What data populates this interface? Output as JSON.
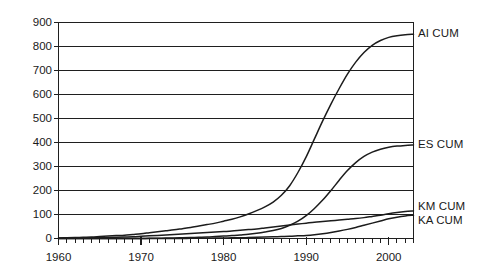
{
  "chart_data": {
    "type": "line",
    "title": "",
    "subtitle": "",
    "xlabel": "",
    "ylabel": "",
    "xlim": [
      1960,
      2003
    ],
    "ylim": [
      0,
      900
    ],
    "grid": true,
    "legend_position": "right-of-plot-at-series-end",
    "y_ticks": [
      0,
      100,
      200,
      300,
      400,
      500,
      600,
      700,
      800,
      900
    ],
    "y_tick_labels": [
      "0",
      "100",
      "200",
      "300",
      "400",
      "500",
      "600",
      "700",
      "800",
      "900"
    ],
    "x_ticks": [
      1960,
      1970,
      1980,
      1990,
      2000
    ],
    "x_tick_labels": [
      "1960",
      "1970",
      "1980",
      "1990",
      "2000"
    ],
    "x_minor_tick_interval": 1,
    "series": [
      {
        "name": "AI CUM",
        "label": "AI CUM",
        "color": "#1c1c1c",
        "x": [
          1960,
          1961,
          1962,
          1963,
          1964,
          1965,
          1966,
          1967,
          1968,
          1969,
          1970,
          1971,
          1972,
          1973,
          1974,
          1975,
          1976,
          1977,
          1978,
          1979,
          1980,
          1981,
          1982,
          1983,
          1984,
          1985,
          1986,
          1987,
          1988,
          1989,
          1990,
          1991,
          1992,
          1993,
          1994,
          1995,
          1996,
          1997,
          1998,
          1999,
          2000,
          2001,
          2002,
          2003
        ],
        "values": [
          2,
          3,
          4,
          5,
          6,
          8,
          10,
          12,
          14,
          17,
          20,
          24,
          28,
          32,
          36,
          41,
          46,
          52,
          58,
          64,
          72,
          80,
          90,
          102,
          116,
          132,
          152,
          180,
          220,
          275,
          340,
          415,
          490,
          560,
          625,
          685,
          735,
          775,
          805,
          825,
          838,
          845,
          849,
          851
        ],
        "end_value": 851
      },
      {
        "name": "ES CUM",
        "label": "ES CUM",
        "color": "#1c1c1c",
        "x": [
          1960,
          1961,
          1962,
          1963,
          1964,
          1965,
          1966,
          1967,
          1968,
          1969,
          1970,
          1971,
          1972,
          1973,
          1974,
          1975,
          1976,
          1977,
          1978,
          1979,
          1980,
          1981,
          1982,
          1983,
          1984,
          1985,
          1986,
          1987,
          1988,
          1989,
          1990,
          1991,
          1992,
          1993,
          1994,
          1995,
          1996,
          1997,
          1998,
          1999,
          2000,
          2001,
          2002,
          2003
        ],
        "values": [
          0,
          0,
          0,
          0,
          0,
          0,
          0,
          0,
          0,
          0,
          0,
          1,
          1,
          2,
          2,
          3,
          4,
          5,
          6,
          8,
          10,
          12,
          15,
          18,
          22,
          27,
          33,
          42,
          55,
          72,
          95,
          125,
          160,
          200,
          243,
          283,
          316,
          342,
          360,
          372,
          380,
          385,
          388,
          390
        ],
        "end_value": 390
      },
      {
        "name": "KM CUM",
        "label": "KM CUM",
        "color": "#1c1c1c",
        "x": [
          1960,
          1961,
          1962,
          1963,
          1964,
          1965,
          1966,
          1967,
          1968,
          1969,
          1970,
          1971,
          1972,
          1973,
          1974,
          1975,
          1976,
          1977,
          1978,
          1979,
          1980,
          1981,
          1982,
          1983,
          1984,
          1985,
          1986,
          1987,
          1988,
          1989,
          1990,
          1991,
          1992,
          1993,
          1994,
          1995,
          1996,
          1997,
          1998,
          1999,
          2000,
          2001,
          2002,
          2003
        ],
        "values": [
          1,
          1,
          2,
          2,
          3,
          3,
          4,
          5,
          6,
          7,
          9,
          11,
          13,
          15,
          17,
          19,
          21,
          23,
          25,
          27,
          29,
          31,
          34,
          37,
          40,
          44,
          48,
          52,
          56,
          60,
          64,
          68,
          71,
          74,
          77,
          80,
          83,
          87,
          92,
          97,
          103,
          108,
          112,
          115
        ],
        "end_value": 115
      },
      {
        "name": "KA CUM",
        "label": "KA CUM",
        "color": "#1c1c1c",
        "x": [
          1960,
          1961,
          1962,
          1963,
          1964,
          1965,
          1966,
          1967,
          1968,
          1969,
          1970,
          1971,
          1972,
          1973,
          1974,
          1975,
          1976,
          1977,
          1978,
          1979,
          1980,
          1981,
          1982,
          1983,
          1984,
          1985,
          1986,
          1987,
          1988,
          1989,
          1990,
          1991,
          1992,
          1993,
          1994,
          1995,
          1996,
          1997,
          1998,
          1999,
          2000,
          2001,
          2002,
          2003
        ],
        "values": [
          0,
          0,
          0,
          0,
          0,
          0,
          0,
          0,
          0,
          0,
          0,
          0,
          0,
          0,
          0,
          0,
          1,
          1,
          1,
          2,
          2,
          3,
          3,
          4,
          5,
          6,
          7,
          8,
          9,
          11,
          13,
          16,
          20,
          25,
          31,
          38,
          46,
          55,
          64,
          73,
          82,
          89,
          94,
          97
        ],
        "end_value": 97
      }
    ]
  },
  "axes": {
    "y_labels": [
      "900",
      "800",
      "700",
      "600",
      "500",
      "400",
      "300",
      "200",
      "100",
      "0"
    ],
    "x_labels": [
      "1960",
      "1970",
      "1980",
      "1990",
      "2000"
    ]
  },
  "series_labels": {
    "ai": "AI CUM",
    "es": "ES CUM",
    "km": "KM CUM",
    "ka": "KA CUM"
  },
  "colors": {
    "line": "#1c1c1c",
    "grid": "#1f1f1f",
    "background": "#ffffff",
    "text": "#1a1a1a"
  }
}
